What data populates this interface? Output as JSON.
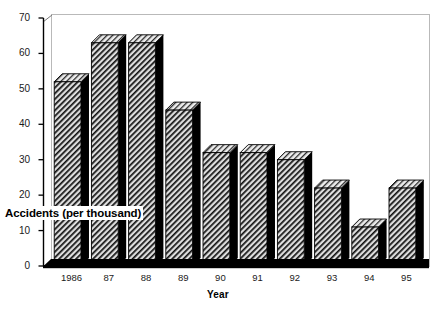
{
  "chart_data": {
    "type": "bar",
    "title": "",
    "xlabel": "Year",
    "ylabel": "Accidents (per thousand)",
    "categories": [
      "1986",
      "87",
      "88",
      "89",
      "90",
      "91",
      "92",
      "93",
      "94",
      "95"
    ],
    "values": [
      52,
      63,
      63,
      44,
      32,
      32,
      30,
      22,
      11,
      22
    ],
    "series": [
      {
        "name": "Accidents (per thousand)",
        "values": [
          52,
          63,
          63,
          44,
          32,
          32,
          30,
          22,
          11,
          22
        ]
      }
    ],
    "ylim": [
      0,
      70
    ],
    "yticks": [
      0,
      10,
      20,
      30,
      40,
      50,
      60,
      70
    ],
    "ytick_labels": [
      "0",
      "10",
      "20",
      "30",
      "40",
      "50",
      "60",
      "70"
    ],
    "grid": false,
    "legend": "none",
    "style": "3d-bars-hatched",
    "colors": {
      "bar_face": "#d9d9d9",
      "bar_hatch": "#000000",
      "bar_side": "#000000",
      "bar_top": "#e8e8e8",
      "axis": "#000000",
      "frame": "#b5b5b5",
      "background": "#ffffff",
      "text": "#000000"
    }
  }
}
